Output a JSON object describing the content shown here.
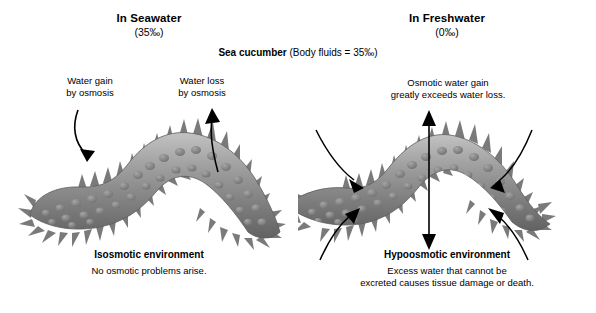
{
  "diagram": {
    "organism": {
      "name": "Sea cucumber",
      "body_fluids": " (Body fluids = 35‰)"
    },
    "colors": {
      "body_mid": "#8e8e8e",
      "body_dark": "#6a6a6a",
      "body_light": "#b9b9b9",
      "arrow": "#000000",
      "background": "#ffffff",
      "text": "#000000"
    }
  },
  "panels": {
    "seawater": {
      "heading": "In Seawater",
      "salinity": "(35‰)",
      "annotations": [
        {
          "id": "water-gain",
          "text": "Water gain\nby osmosis",
          "line1": "Water gain",
          "line2": "by osmosis"
        },
        {
          "id": "water-loss",
          "text": "Water loss\nby osmosis",
          "line1": "Water loss",
          "line2": "by osmosis"
        }
      ],
      "footer_title": "Isosmotic environment",
      "footer_text": "No osmotic problems arise.",
      "arrows": [
        {
          "name": "water-gain-arrow",
          "direction": "inward-down-right"
        },
        {
          "name": "water-loss-arrow",
          "direction": "outward-up"
        }
      ]
    },
    "freshwater": {
      "heading": "In Freshwater",
      "salinity": "(0‰)",
      "annotations": [
        {
          "id": "osmotic-gain",
          "line1": "Osmotic water gain",
          "line2": "greatly exceeds water loss."
        }
      ],
      "footer_title": "Hypoosmotic environment",
      "footer_text_line1": "Excess water that cannot be",
      "footer_text_line2": "excreted causes tissue damage or death.",
      "arrows": [
        {
          "name": "inward-arrow-top-left",
          "direction": "inward"
        },
        {
          "name": "inward-arrow-bottom-left",
          "direction": "inward"
        },
        {
          "name": "inward-arrow-top-right",
          "direction": "inward"
        },
        {
          "name": "inward-arrow-bottom-right",
          "direction": "inward"
        },
        {
          "name": "vertical-double-arrow",
          "direction": "bidirectional-vertical"
        }
      ]
    }
  }
}
